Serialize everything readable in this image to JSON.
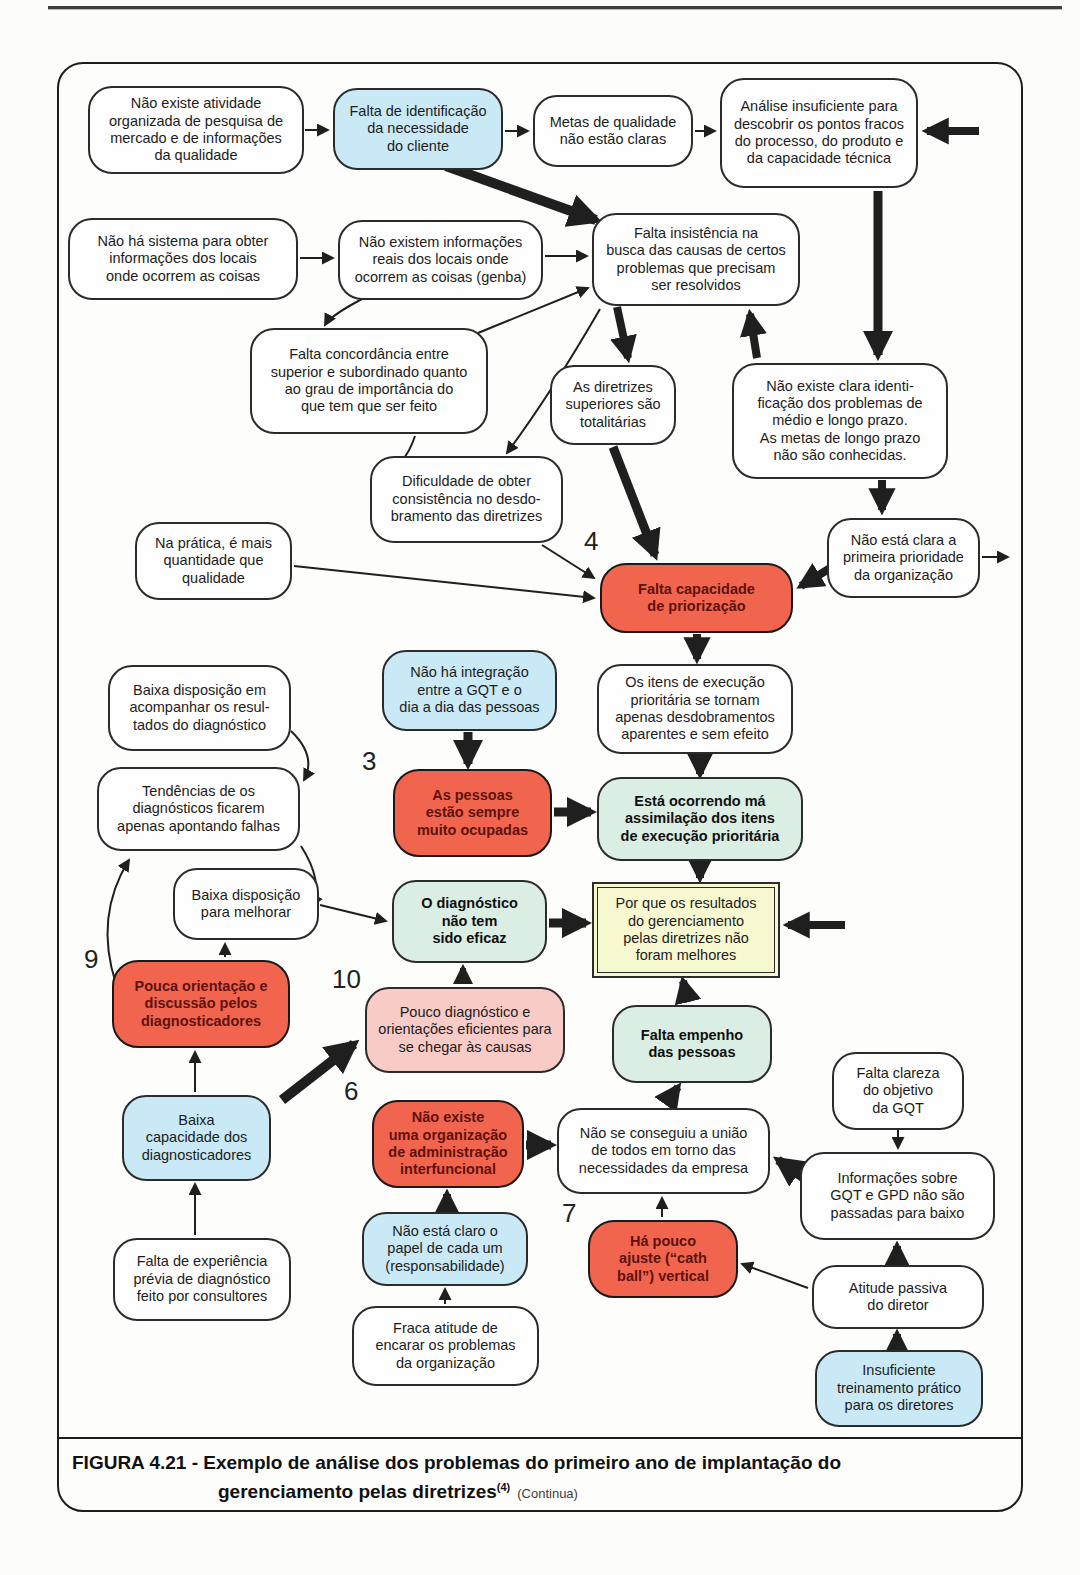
{
  "caption": {
    "figure_label": "FIGURA 4.21 -",
    "line1": "Exemplo de análise dos problemas do primeiro ano de implantação do",
    "line2": "gerenciamento pelas diretrizes",
    "footnote_ref": "(4)",
    "continua": "(Continua)"
  },
  "colors": {
    "arrow": "#1f1f1f",
    "node_border": "#2b2b2b",
    "blue": "#c9e9f6",
    "red": "#f1654f",
    "red_text": "#5e120d",
    "pink": "#f8cbc6",
    "green": "#dbeee4",
    "yellow": "#f8f8d0",
    "white": "#fefefe"
  },
  "diagram": {
    "nodes": [
      {
        "id": "sem-pesquisa-de-mercado",
        "style": "white",
        "x": 88,
        "y": 86,
        "w": 216,
        "h": 88,
        "text": "Não existe atividade\norganizada de pesquisa de\nmercado e de informações\nda qualidade"
      },
      {
        "id": "falta-identificacao-necessidade-cliente",
        "style": "blue",
        "x": 333,
        "y": 88,
        "w": 170,
        "h": 82,
        "text": "Falta de identificação\nda necessidade\ndo cliente"
      },
      {
        "id": "metas-qualidade-nao-claras",
        "style": "white",
        "x": 533,
        "y": 95,
        "w": 160,
        "h": 72,
        "text": "Metas de qualidade\nnão estão claras"
      },
      {
        "id": "analise-insuficiente-pontos-fracos",
        "style": "white",
        "x": 720,
        "y": 78,
        "w": 198,
        "h": 110,
        "text": "Análise insuficiente para\ndescobrir os pontos fracos\ndo processo, do produto e\nda capacidade técnica"
      },
      {
        "id": "sem-sistema-informacoes-locais",
        "style": "white",
        "x": 68,
        "y": 218,
        "w": 230,
        "h": 82,
        "text": "Não há sistema para obter\ninformações dos locais\nonde ocorrem as coisas"
      },
      {
        "id": "sem-informacoes-reais-genba",
        "style": "white",
        "x": 338,
        "y": 220,
        "w": 205,
        "h": 80,
        "text": "Não existem informações\nreais dos locais onde\nocorrem as coisas (genba)"
      },
      {
        "id": "falta-insistencia-busca-causas",
        "style": "white",
        "x": 592,
        "y": 213,
        "w": 208,
        "h": 93,
        "text": "Falta insistência na\nbusca das causas de certos\nproblemas que precisam\nser resolvidos"
      },
      {
        "id": "falta-concordancia-superior-subordinado",
        "style": "white",
        "x": 250,
        "y": 328,
        "w": 238,
        "h": 106,
        "text": "Falta concordância entre\nsuperior e subordinado quanto\nao grau de importância do\nque tem que ser feito"
      },
      {
        "id": "diretrizes-superiores-totalitarias",
        "style": "white",
        "x": 550,
        "y": 365,
        "w": 126,
        "h": 80,
        "text": "As diretrizes\nsuperiores são\ntotalitárias"
      },
      {
        "id": "sem-identificacao-problemas-longo-prazo",
        "style": "white",
        "x": 732,
        "y": 363,
        "w": 216,
        "h": 116,
        "text": "Não existe clara identi-\nficação dos problemas de\nmédio e longo prazo.\nAs metas de longo prazo\nnão são conhecidas."
      },
      {
        "id": "dificuldade-consistencia-desdobramento",
        "style": "white",
        "x": 370,
        "y": 456,
        "w": 193,
        "h": 87,
        "text": "Dificuldade de obter\nconsistência no desdo-\nbramento das diretrizes"
      },
      {
        "id": "primeira-prioridade-nao-clara",
        "style": "white",
        "x": 827,
        "y": 518,
        "w": 153,
        "h": 80,
        "text": "Não está clara a\nprimeira prioridade\nda organização"
      },
      {
        "id": "mais-quantidade-que-qualidade",
        "style": "white",
        "x": 135,
        "y": 522,
        "w": 157,
        "h": 78,
        "text": "Na prática, é mais\nquantidade que\nqualidade"
      },
      {
        "id": "falta-capacidade-priorizacao",
        "style": "red",
        "x": 600,
        "y": 563,
        "w": 193,
        "h": 70,
        "text": "Falta capacidade\nde priorização"
      },
      {
        "id": "itens-execucao-desdobramentos-aparentes",
        "style": "white",
        "x": 597,
        "y": 664,
        "w": 196,
        "h": 90,
        "text": "Os itens de execução\nprioritária se tornam\napenas desdobramentos\naparentes e sem efeito"
      },
      {
        "id": "baixa-disposicao-acompanhar-resultados",
        "style": "white",
        "x": 108,
        "y": 665,
        "w": 183,
        "h": 86,
        "text": "Baixa disposição em\nacompanhar os resul-\ntados do diagnóstico"
      },
      {
        "id": "sem-integracao-gqt-dia-a-dia",
        "style": "blue",
        "x": 382,
        "y": 650,
        "w": 175,
        "h": 81,
        "text": "Não há integração\nentre a GQT e o\ndia a dia das pessoas"
      },
      {
        "id": "diagnosticos-apontando-falhas",
        "style": "white",
        "x": 97,
        "y": 767,
        "w": 203,
        "h": 84,
        "text": "Tendências de os\ndiagnósticos ficarem\napenas apontando falhas"
      },
      {
        "id": "pessoas-sempre-ocupadas",
        "style": "red",
        "x": 393,
        "y": 769,
        "w": 159,
        "h": 88,
        "text": "As pessoas\nestão sempre\nmuito ocupadas"
      },
      {
        "id": "ma-assimilacao-itens-prioritarios",
        "style": "green",
        "x": 597,
        "y": 777,
        "w": 206,
        "h": 84,
        "text": "Está ocorrendo má\nassimilação dos itens\nde execução prioritária"
      },
      {
        "id": "baixa-disposicao-melhorar",
        "style": "white",
        "x": 173,
        "y": 868,
        "w": 146,
        "h": 72,
        "text": "Baixa disposição\npara melhorar"
      },
      {
        "id": "diagnostico-nao-eficaz",
        "style": "green",
        "x": 392,
        "y": 880,
        "w": 155,
        "h": 83,
        "text": "O diagnóstico\nnão tem\nsido eficaz"
      },
      {
        "id": "resultados-gpd-nao-melhores",
        "style": "yellow",
        "x": 592,
        "y": 882,
        "w": 188,
        "h": 96,
        "text": "Por que os resultados\ndo gerenciamento\npelas diretrizes não\nforam melhores"
      },
      {
        "id": "pouca-orientacao-diagnosticadores",
        "style": "red",
        "x": 112,
        "y": 960,
        "w": 178,
        "h": 88,
        "text": "Pouca orientação e\ndiscussão pelos\ndiagnosticadores"
      },
      {
        "id": "pouco-diagnostico-eficiente",
        "style": "pink",
        "x": 365,
        "y": 987,
        "w": 200,
        "h": 86,
        "text": "Pouco diagnóstico e\norientações eficientes para\nse chegar às causas"
      },
      {
        "id": "falta-empenho-pessoas",
        "style": "green",
        "x": 612,
        "y": 1005,
        "w": 160,
        "h": 78,
        "text": "Falta empenho\ndas pessoas"
      },
      {
        "id": "falta-clareza-objetivo-gqt",
        "style": "white",
        "x": 832,
        "y": 1052,
        "w": 132,
        "h": 78,
        "text": "Falta clareza\ndo objetivo\nda GQT"
      },
      {
        "id": "baixa-capacidade-diagnosticadores",
        "style": "blue",
        "x": 122,
        "y": 1095,
        "w": 149,
        "h": 86,
        "text": "Baixa\ncapacidade dos\ndiagnosticadores"
      },
      {
        "id": "sem-organizacao-interfuncional",
        "style": "red",
        "x": 372,
        "y": 1100,
        "w": 152,
        "h": 88,
        "text": "Não existe\numa organização\nde administração\ninterfuncional"
      },
      {
        "id": "sem-uniao-necessidades-empresa",
        "style": "white",
        "x": 557,
        "y": 1108,
        "w": 213,
        "h": 86,
        "text": "Não se conseguiu a união\nde todos em torno das\nnecessidades da empresa"
      },
      {
        "id": "informacoes-gqt-gpd-nao-passadas",
        "style": "white",
        "x": 800,
        "y": 1152,
        "w": 195,
        "h": 88,
        "text": "Informações sobre\nGQT e GPD não são\npassadas para baixo"
      },
      {
        "id": "papel-de-cada-um-nao-claro",
        "style": "blue",
        "x": 362,
        "y": 1212,
        "w": 166,
        "h": 74,
        "text": "Não está claro o\npapel de cada um\n(responsabilidade)"
      },
      {
        "id": "pouco-ajuste-catch-ball-vertical",
        "style": "red",
        "x": 588,
        "y": 1220,
        "w": 150,
        "h": 78,
        "text": "Há pouco\najuste (“cath\nball”) vertical"
      },
      {
        "id": "atitude-passiva-diretor",
        "style": "white",
        "x": 812,
        "y": 1265,
        "w": 172,
        "h": 64,
        "text": "Atitude passiva\ndo diretor"
      },
      {
        "id": "falta-experiencia-previa-diagnostico",
        "style": "white",
        "x": 113,
        "y": 1238,
        "w": 178,
        "h": 83,
        "text": "Falta de experiência\nprévia de diagnóstico\nfeito por consultores"
      },
      {
        "id": "fraca-atitude-encarar-problemas",
        "style": "white",
        "x": 352,
        "y": 1306,
        "w": 187,
        "h": 80,
        "text": "Fraca atitude de\nencarar os problemas\nda organização"
      },
      {
        "id": "insuficiente-treinamento-diretores",
        "style": "blue",
        "x": 815,
        "y": 1350,
        "w": 168,
        "h": 77,
        "text": "Insuficiente\ntreinamento prático\npara os diretores"
      }
    ],
    "number_labels": [
      {
        "text": "4",
        "x": 584,
        "y": 526
      },
      {
        "text": "3",
        "x": 362,
        "y": 746
      },
      {
        "text": "9",
        "x": 84,
        "y": 944
      },
      {
        "text": "10",
        "x": 332,
        "y": 964
      },
      {
        "text": "6",
        "x": 344,
        "y": 1076
      },
      {
        "text": "7",
        "x": 562,
        "y": 1198
      }
    ],
    "arrows": [
      {
        "k": "thin",
        "x1": 305,
        "y1": 130,
        "x2": 328,
        "y2": 130
      },
      {
        "k": "thin",
        "x1": 505,
        "y1": 131,
        "x2": 528,
        "y2": 131
      },
      {
        "k": "thin",
        "x1": 695,
        "y1": 131,
        "x2": 715,
        "y2": 131
      },
      {
        "k": "thin",
        "x1": 300,
        "y1": 258,
        "x2": 333,
        "y2": 258
      },
      {
        "k": "thin",
        "x1": 545,
        "y1": 256,
        "x2": 587,
        "y2": 256
      },
      {
        "k": "thin",
        "x1": 478,
        "y1": 333,
        "x2": 588,
        "y2": 288
      },
      {
        "k": "thin",
        "x1": 362,
        "y1": 299,
        "c": [
          330,
          316
        ],
        "x2": 325,
        "y2": 325
      },
      {
        "k": "thin",
        "x1": 415,
        "y1": 436,
        "c": [
          403,
          472
        ],
        "x2": 380,
        "y2": 468
      },
      {
        "k": "thin",
        "x1": 600,
        "y1": 309,
        "c": [
          552,
          392
        ],
        "x2": 507,
        "y2": 453
      },
      {
        "k": "thin",
        "x1": 294,
        "y1": 566,
        "x2": 594,
        "y2": 598
      },
      {
        "k": "thin",
        "x1": 542,
        "y1": 545,
        "x2": 594,
        "y2": 578
      },
      {
        "k": "thin",
        "x1": 982,
        "y1": 557,
        "x2": 1008,
        "y2": 557
      },
      {
        "k": "thin",
        "x1": 291,
        "y1": 731,
        "c": [
          317,
          756
        ],
        "x2": 304,
        "y2": 780
      },
      {
        "k": "thin",
        "x1": 301,
        "y1": 846,
        "c": [
          324,
          882
        ],
        "x2": 312,
        "y2": 906
      },
      {
        "k": "thin",
        "x1": 116,
        "y1": 984,
        "c": [
          94,
          916
        ],
        "x2": 129,
        "y2": 860
      },
      {
        "k": "thin",
        "x1": 320,
        "y1": 905,
        "x2": 386,
        "y2": 921
      },
      {
        "k": "thin",
        "x1": 225,
        "y1": 957,
        "x2": 225,
        "y2": 944
      },
      {
        "k": "thin",
        "x1": 195,
        "y1": 1092,
        "x2": 195,
        "y2": 1052
      },
      {
        "k": "thin",
        "x1": 195,
        "y1": 1235,
        "x2": 195,
        "y2": 1184
      },
      {
        "k": "thin",
        "x1": 898,
        "y1": 1125,
        "x2": 898,
        "y2": 1148
      },
      {
        "k": "thin",
        "x1": 808,
        "y1": 1288,
        "x2": 742,
        "y2": 1264
      },
      {
        "k": "thin",
        "x1": 662,
        "y1": 1217,
        "x2": 662,
        "y2": 1198
      },
      {
        "k": "thin",
        "x1": 445,
        "y1": 1304,
        "x2": 445,
        "y2": 1289
      },
      {
        "k": "thick",
        "w": 10,
        "x1": 446,
        "y1": 166,
        "x2": 596,
        "y2": 220
      },
      {
        "k": "thick",
        "w": 9,
        "x1": 878,
        "y1": 191,
        "x2": 878,
        "y2": 355
      },
      {
        "k": "thick",
        "w": 8,
        "x1": 617,
        "y1": 307,
        "x2": 628,
        "y2": 358
      },
      {
        "k": "thick",
        "w": 8,
        "x1": 757,
        "y1": 358,
        "x2": 750,
        "y2": 314
      },
      {
        "k": "thick",
        "w": 9,
        "x1": 613,
        "y1": 447,
        "x2": 655,
        "y2": 555
      },
      {
        "k": "thick",
        "w": 8,
        "x1": 882,
        "y1": 480,
        "x2": 882,
        "y2": 510
      },
      {
        "k": "thick",
        "w": 8,
        "x1": 845,
        "y1": 559,
        "x2": 801,
        "y2": 586
      },
      {
        "k": "thick",
        "w": 8,
        "x1": 697,
        "y1": 634,
        "x2": 697,
        "y2": 659
      },
      {
        "k": "thick",
        "w": 8,
        "x1": 700,
        "y1": 755,
        "x2": 700,
        "y2": 774
      },
      {
        "k": "thick",
        "w": 9,
        "x1": 468,
        "y1": 732,
        "x2": 468,
        "y2": 764
      },
      {
        "k": "thick",
        "w": 9,
        "x1": 554,
        "y1": 812,
        "x2": 591,
        "y2": 812
      },
      {
        "k": "thick",
        "w": 8,
        "x1": 700,
        "y1": 862,
        "x2": 700,
        "y2": 878
      },
      {
        "k": "thick",
        "w": 9,
        "x1": 549,
        "y1": 923,
        "x2": 586,
        "y2": 923
      },
      {
        "k": "thick",
        "w": 8,
        "x1": 845,
        "y1": 925,
        "x2": 788,
        "y2": 925
      },
      {
        "k": "thick",
        "w": 8,
        "x1": 688,
        "y1": 1002,
        "x2": 683,
        "y2": 981
      },
      {
        "k": "thick",
        "w": 8,
        "x1": 666,
        "y1": 1104,
        "x2": 678,
        "y2": 1087
      },
      {
        "k": "thick",
        "w": 10,
        "x1": 282,
        "y1": 1100,
        "x2": 354,
        "y2": 1044
      },
      {
        "k": "thick",
        "w": 9,
        "x1": 526,
        "y1": 1145,
        "x2": 551,
        "y2": 1145
      },
      {
        "k": "thick",
        "w": 8,
        "x1": 447,
        "y1": 1210,
        "x2": 447,
        "y2": 1194
      },
      {
        "k": "thick",
        "w": 9,
        "x1": 812,
        "y1": 1184,
        "x2": 778,
        "y2": 1160
      },
      {
        "k": "thick",
        "w": 8,
        "x1": 897,
        "y1": 1262,
        "x2": 897,
        "y2": 1246
      },
      {
        "k": "thick",
        "w": 8,
        "x1": 897,
        "y1": 1349,
        "x2": 897,
        "y2": 1334
      },
      {
        "k": "thick",
        "w": 8,
        "x1": 979,
        "y1": 131,
        "x2": 927,
        "y2": 131
      },
      {
        "k": "thick",
        "w": 6,
        "x1": 463,
        "y1": 984,
        "x2": 463,
        "y2": 968
      }
    ]
  }
}
